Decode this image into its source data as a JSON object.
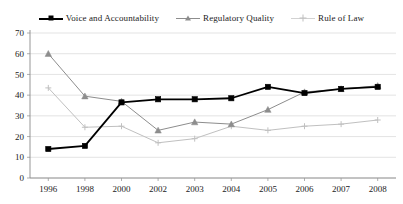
{
  "top_bleed_text": "g      p            p                 g",
  "legend": {
    "position": "top-center",
    "items": [
      {
        "label": "Voice and Accountability",
        "marker": "square",
        "color": "#000000",
        "icon": "legend-swatch-square"
      },
      {
        "label": "Regulatory Quality",
        "marker": "triangle",
        "color": "#8d8d8d",
        "icon": "legend-swatch-triangle"
      },
      {
        "label": "Rule of Law",
        "marker": "plus",
        "color": "#c0c0c0",
        "icon": "legend-swatch-plus"
      }
    ]
  },
  "axes": {
    "y_ticks": [
      "0",
      "10",
      "20",
      "30",
      "40",
      "50",
      "60",
      "70"
    ],
    "x_ticks": [
      "1996",
      "1998",
      "2000",
      "2002",
      "2003",
      "2004",
      "2005",
      "2006",
      "2007",
      "2008"
    ]
  },
  "chart_data": {
    "type": "line",
    "title": "",
    "xlabel": "",
    "ylabel": "",
    "ylim": [
      0,
      70
    ],
    "ytick_step": 10,
    "grid": true,
    "legend_position": "top-center",
    "categories": [
      "1996",
      "1998",
      "2000",
      "2002",
      "2003",
      "2004",
      "2005",
      "2006",
      "2007",
      "2008"
    ],
    "series": [
      {
        "name": "Voice and Accountability",
        "color": "#000000",
        "marker": "square",
        "values": [
          14,
          15.5,
          36.5,
          38,
          38,
          38.5,
          44,
          41,
          43,
          44
        ]
      },
      {
        "name": "Regulatory Quality",
        "color": "#8d8d8d",
        "marker": "triangle",
        "values": [
          60,
          39.5,
          37,
          23,
          27,
          26,
          33,
          41.5,
          43,
          44.5
        ]
      },
      {
        "name": "Rule of Law",
        "color": "#c0c0c0",
        "marker": "plus",
        "values": [
          43.5,
          24.5,
          25,
          17,
          19,
          25,
          23,
          25,
          26,
          28
        ]
      }
    ]
  }
}
